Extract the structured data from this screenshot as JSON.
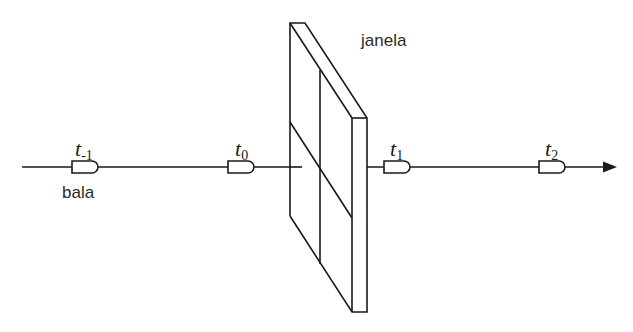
{
  "diagram": {
    "title": "",
    "labels": {
      "window": "janela",
      "bullet": "bala"
    },
    "time_marks": [
      {
        "symbol": "t",
        "subscript": "-1",
        "x": 243
      },
      {
        "symbol": "t",
        "subscript": "0",
        "x": 245
      },
      {
        "symbol": "t",
        "subscript": "1",
        "x": 398
      },
      {
        "symbol": "t",
        "subscript": "2",
        "x": 553
      }
    ],
    "colors": {
      "stroke": "#1a1a1a",
      "background": "#ffffff"
    }
  }
}
